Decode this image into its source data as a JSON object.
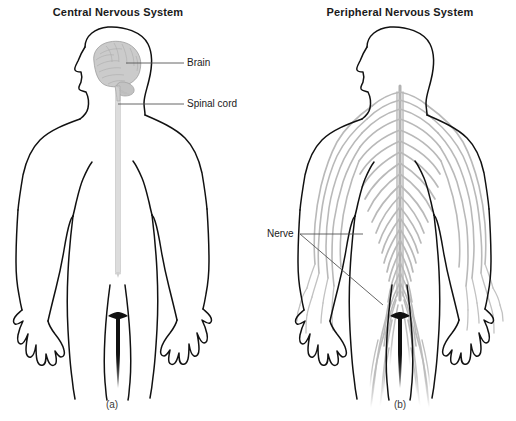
{
  "figure": {
    "background_color": "#ffffff",
    "width": 516,
    "height": 421,
    "outline_color": "#111111",
    "nerve_color": "#b9b9b9",
    "brain_color": "#c9c9c9",
    "cord_color": "#d8d8d8",
    "leader_color": "#555555"
  },
  "panels": [
    {
      "id": "cns",
      "title": "Central Nervous System",
      "caption": "(a)",
      "labels": [
        {
          "name": "brain",
          "text": "Brain"
        },
        {
          "name": "spinal-cord",
          "text": "Spinal cord"
        }
      ]
    },
    {
      "id": "pns",
      "title": "Peripheral Nervous System",
      "caption": "(b)",
      "labels": [
        {
          "name": "nerve",
          "text": "Nerve"
        }
      ]
    }
  ],
  "titles": {
    "cns": "Central Nervous System",
    "pns": "Peripheral Nervous System"
  },
  "captions": {
    "a": "(a)",
    "b": "(b)"
  },
  "callouts": {
    "brain": "Brain",
    "spinal_cord": "Spinal cord",
    "nerve": "Nerve"
  }
}
